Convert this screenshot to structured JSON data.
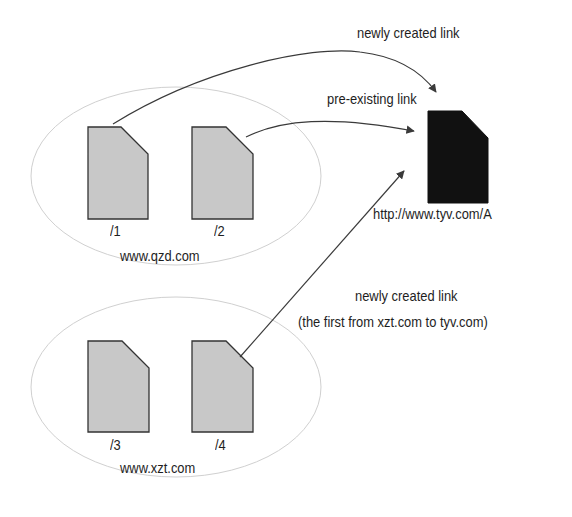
{
  "diagram": {
    "sites": [
      {
        "domain": "www.qzd.com",
        "pages": [
          {
            "path": "/1"
          },
          {
            "path": "/2"
          }
        ]
      },
      {
        "domain": "www.xzt.com",
        "pages": [
          {
            "path": "/3"
          },
          {
            "path": "/4"
          }
        ]
      }
    ],
    "target": {
      "url": "http://www.tyv.com/A"
    },
    "links": [
      {
        "from": "/1",
        "label": "newly created link"
      },
      {
        "from": "/2",
        "label": "pre-existing link"
      },
      {
        "from": "/4",
        "label_line1": "newly created link",
        "label_line2": "(the first from xzt.com to tyv.com)"
      }
    ]
  },
  "colors": {
    "page_fill": "#c8c8c8",
    "page_stroke": "#333333",
    "target_fill": "#111111",
    "ellipse_stroke": "#cfcfcf",
    "arrow": "#3a3a3a"
  }
}
